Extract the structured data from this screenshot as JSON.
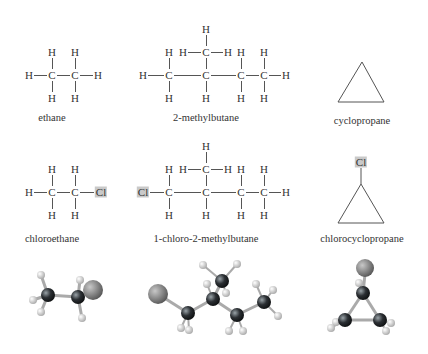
{
  "molecules": {
    "ethane": {
      "name": "ethane",
      "formula_atoms": {
        "H": "H",
        "C": "C"
      }
    },
    "methylbutane": {
      "name": "2-methylbutane"
    },
    "cyclopropane": {
      "name": "cyclopropane"
    },
    "chloroethane": {
      "name": "chloroethane",
      "substituent": "Cl"
    },
    "chloromethylbutane": {
      "name": "1-chloro-2-methylbutane",
      "substituent": "Cl"
    },
    "chlorocyclopropane": {
      "name": "chlorocyclopropane",
      "substituent": "Cl"
    }
  },
  "atoms": {
    "H": "H",
    "C": "C",
    "Cl": "Cl"
  },
  "colors": {
    "highlight": "#c9c9c9",
    "bond": "#555555",
    "carbon": "#2b2f33",
    "hydrogen": "#f2f2f2",
    "chlorine": "#8a8a8a"
  }
}
